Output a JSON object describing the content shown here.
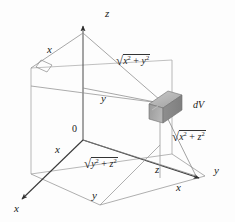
{
  "figure": {
    "background_color": "#fdfdfd",
    "line_color": "#5a5a5a",
    "axis_color": "#3a3a3a",
    "box_fill": "#a8a8a8",
    "text_color": "#1a1a1a"
  },
  "axes": {
    "z_label": "z",
    "y_label": "y",
    "x_label": "x",
    "origin_label": "0"
  },
  "labels": {
    "edge_x_top": "x",
    "edge_y_middle": "y",
    "edge_x_left": "x",
    "edge_y_bottom": "y",
    "edge_z_right": "z",
    "edge_x_bottom_right": "x",
    "volume_element": "dV"
  },
  "radicals": {
    "xy": {
      "radicand_1": "x",
      "exp_1": "2",
      "operator": " + ",
      "radicand_2": "y",
      "exp_2": "2"
    },
    "xz": {
      "radicand_1": "x",
      "exp_1": "2",
      "operator": " + ",
      "radicand_2": "z",
      "exp_2": "2"
    },
    "yz": {
      "radicand_1": "y",
      "exp_1": "2",
      "operator": " + ",
      "radicand_2": "z",
      "exp_2": "2"
    }
  }
}
